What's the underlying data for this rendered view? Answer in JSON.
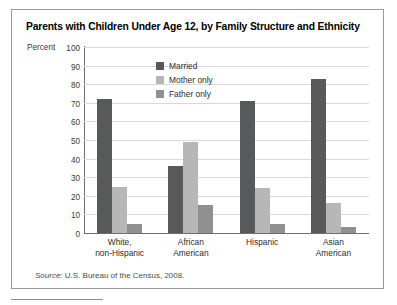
{
  "figure": {
    "title": "Parents with Children Under Age 12, by Family Structure and Ethnicity",
    "source_prefix": "Source:",
    "source_text": " U.S. Bureau of the Census, 2008."
  },
  "chart_data": {
    "type": "bar",
    "title": "Parents with Children Under Age 12, by Family Structure and Ethnicity",
    "xlabel": "",
    "ylabel": "Percent",
    "ylim": [
      0,
      100
    ],
    "ytick_step": 10,
    "yticks": [
      100,
      90,
      80,
      70,
      60,
      50,
      40,
      30,
      20,
      10,
      0
    ],
    "ytick_labels": [
      "100",
      "90",
      "80",
      "70",
      "60",
      "50",
      "40",
      "30",
      "20",
      "10",
      "0"
    ],
    "grid": true,
    "legend_position": "inside-top-left",
    "categories": [
      "White, non-Hispanic",
      "African American",
      "Hispanic",
      "Asian American"
    ],
    "category_lines": [
      [
        "White,",
        "non-Hispanic"
      ],
      [
        "African",
        "American"
      ],
      [
        "Hispanic",
        ""
      ],
      [
        "Asian",
        "American"
      ]
    ],
    "series": [
      {
        "name": "Married",
        "color": "#58595b",
        "values": [
          72,
          36,
          71,
          83
        ]
      },
      {
        "name": "Mother only",
        "color": "#b7b7b7",
        "values": [
          25,
          49,
          24,
          16
        ]
      },
      {
        "name": "Father only",
        "color": "#8f9092",
        "values": [
          5,
          15,
          5,
          3
        ]
      }
    ]
  }
}
